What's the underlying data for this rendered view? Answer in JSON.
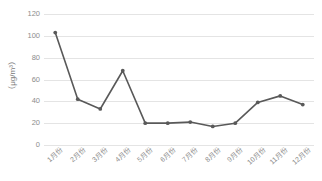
{
  "chart_data": {
    "type": "line",
    "title": "",
    "subtitle": "",
    "xlabel": "",
    "ylabel": "（μg/m³）",
    "categories": [
      "1月份",
      "2月份",
      "3月份",
      "4月份",
      "5月份",
      "6月份",
      "7月份",
      "8月份",
      "9月份",
      "10月份",
      "11月份",
      "12月份"
    ],
    "values": [
      103,
      42,
      33,
      68,
      20,
      20,
      21,
      17,
      20,
      39,
      45,
      37
    ],
    "series": [
      {
        "name": "",
        "values": [
          103,
          42,
          33,
          68,
          20,
          20,
          21,
          17,
          20,
          39,
          45,
          37
        ]
      }
    ],
    "ylim": [
      0,
      120
    ],
    "yticks": [
      0,
      20,
      40,
      60,
      80,
      100,
      120
    ],
    "ytick_labels": [
      "0",
      "20",
      "40",
      "60",
      "80",
      "100",
      "120"
    ],
    "grid": true,
    "grid_axis": "y",
    "legend": false,
    "legend_position": "none",
    "line_color": "#595959",
    "marker": "circle",
    "marker_color": "#595959",
    "grid_color": "#e4e4e4",
    "tick_label_color": "#8c8c8c",
    "background_color": "#ffffff"
  }
}
